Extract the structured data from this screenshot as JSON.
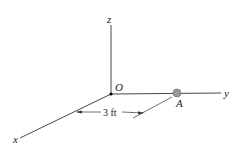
{
  "diagram": {
    "axes": {
      "z": "z",
      "y": "y",
      "x": "x"
    },
    "origin_label": "O",
    "point_label": "A",
    "dimension_label": "3 ft",
    "colors": {
      "line": "#333333",
      "ball": "#999999"
    }
  }
}
